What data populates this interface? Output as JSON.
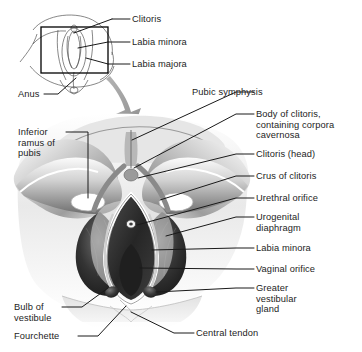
{
  "figure": {
    "title_visible": false,
    "style": "grayscale medical line-and-tone illustration",
    "colors": {
      "background": "#ffffff",
      "text": "#1d1d1d",
      "leader_line": "#1a1a1a",
      "arrow": "#9a9a9a",
      "inset_frame": "#000000",
      "tone_dark": "#2e2e2e",
      "tone_mid": "#8c8c8c",
      "tone_light": "#d8d8d8"
    }
  },
  "inset": {
    "name": "perineum-overview-inset",
    "frame": {
      "x": 41,
      "y": 27,
      "width": 67,
      "height": 46
    },
    "labels": [
      {
        "id": "clitoris",
        "text": "Clitoris",
        "x": 132,
        "y": 15
      },
      {
        "id": "labia-minora",
        "text": "Labia minora",
        "x": 132,
        "y": 38
      },
      {
        "id": "labia-majora",
        "text": "Labia majora",
        "x": 132,
        "y": 60
      },
      {
        "id": "anus",
        "text": "Anus",
        "x": 18,
        "y": 90
      }
    ]
  },
  "magnify_arrow": {
    "name": "magnification-arrow",
    "from": [
      112,
      78
    ],
    "to": [
      140,
      122
    ]
  },
  "main": {
    "name": "perineum-detail-illustration",
    "labels_right": [
      {
        "id": "pubic-symphysis",
        "text": "Pubic symphysis",
        "x": 192,
        "y": 88,
        "lines": 1
      },
      {
        "id": "body-of-clitoris",
        "text": "Body of clitoris,\ncontaining corpora\ncavernosa",
        "x": 256,
        "y": 110,
        "lines": 3
      },
      {
        "id": "clitoris-head",
        "text": "Clitoris (head)",
        "x": 256,
        "y": 150,
        "lines": 1
      },
      {
        "id": "crus-of-clitoris",
        "text": "Crus of clitoris",
        "x": 256,
        "y": 172,
        "lines": 1
      },
      {
        "id": "urethral-orifice",
        "text": "Urethral orifice",
        "x": 256,
        "y": 194,
        "lines": 1
      },
      {
        "id": "urogenital-diaphragm",
        "text": "Urogenital\ndiaphragm",
        "x": 256,
        "y": 213,
        "lines": 2
      },
      {
        "id": "labia-minora-detail",
        "text": "Labia minora",
        "x": 256,
        "y": 244,
        "lines": 1
      },
      {
        "id": "vaginal-orifice",
        "text": "Vaginal orifice",
        "x": 256,
        "y": 265,
        "lines": 1
      },
      {
        "id": "greater-vestibular-gland",
        "text": "Greater\nvestibular\ngland",
        "x": 256,
        "y": 284,
        "lines": 3
      },
      {
        "id": "central-tendon",
        "text": "Central tendon",
        "x": 196,
        "y": 329,
        "lines": 1
      }
    ],
    "labels_left": [
      {
        "id": "inferior-ramus-of-pubis",
        "text": "Inferior\nramus of\npubis",
        "x": 18,
        "y": 128,
        "lines": 3
      },
      {
        "id": "bulb-of-vestibule",
        "text": "Bulb of\nvestibule",
        "x": 14,
        "y": 303,
        "lines": 2
      },
      {
        "id": "fourchette",
        "text": "Fourchette",
        "x": 14,
        "y": 332,
        "lines": 1
      }
    ]
  }
}
